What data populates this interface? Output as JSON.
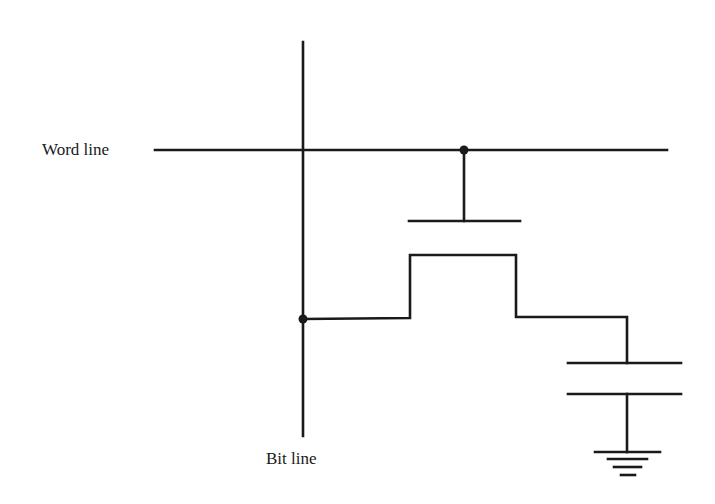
{
  "diagram": {
    "labels": {
      "word_line": "Word line",
      "bit_line": "Bit line"
    },
    "colors": {
      "stroke": "#1a1a1a",
      "background": "#ffffff"
    },
    "components": [
      {
        "id": "word-line",
        "type": "wire",
        "label": "Word line"
      },
      {
        "id": "bit-line",
        "type": "wire",
        "label": "Bit line"
      },
      {
        "id": "access-transistor",
        "type": "mosfet"
      },
      {
        "id": "storage-capacitor",
        "type": "capacitor"
      },
      {
        "id": "ground",
        "type": "ground"
      }
    ],
    "connections": [
      {
        "from": "word-line",
        "to": "access-transistor.gate"
      },
      {
        "from": "bit-line",
        "to": "access-transistor.source"
      },
      {
        "from": "access-transistor.drain",
        "to": "storage-capacitor.top"
      },
      {
        "from": "storage-capacitor.bottom",
        "to": "ground"
      }
    ]
  }
}
